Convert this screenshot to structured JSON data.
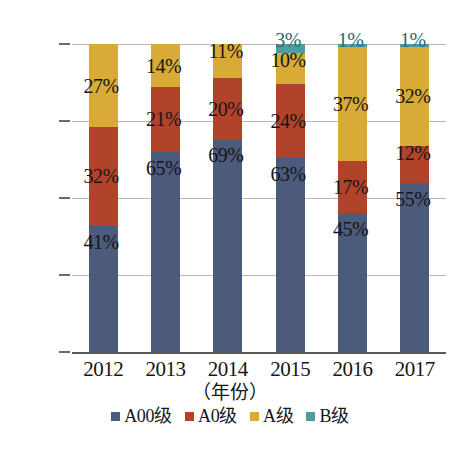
{
  "chart_data": {
    "type": "bar",
    "subtype": "stacked-100-percent",
    "title": "",
    "xlabel": "（年份）",
    "ylabel": "",
    "categories": [
      "2012",
      "2013",
      "2014",
      "2015",
      "2016",
      "2017"
    ],
    "ylim": [
      0,
      100
    ],
    "ytick_labels": [
      "0%",
      "25%",
      "50%",
      "75%",
      "100%"
    ],
    "ytick_values": [
      0,
      25,
      50,
      75,
      100
    ],
    "grid": true,
    "legend_position": "bottom",
    "series": [
      {
        "name": "A00级",
        "color": "#4c5a7c",
        "values": [
          41,
          65,
          69,
          63,
          45,
          55
        ],
        "labels": [
          "41%",
          "65%",
          "69%",
          "63%",
          "45%",
          "55%"
        ]
      },
      {
        "name": "A0级",
        "color": "#b2432b",
        "values": [
          32,
          21,
          20,
          24,
          17,
          12
        ],
        "labels": [
          "32%",
          "21%",
          "20%",
          "24%",
          "17%",
          "12%"
        ]
      },
      {
        "name": "A级",
        "color": "#d7ab35",
        "values": [
          27,
          14,
          11,
          10,
          37,
          32
        ],
        "labels": [
          "27%",
          "14%",
          "11%",
          "10%",
          "37%",
          "32%"
        ]
      },
      {
        "name": "B级",
        "color": "#4e9c9c",
        "values": [
          0,
          0,
          0,
          3,
          1,
          1
        ],
        "labels": [
          "",
          "",
          "",
          "3%",
          "1%",
          "1%"
        ]
      }
    ]
  },
  "axis": {
    "y_ticks": [
      {
        "label": "100%",
        "value": 100
      },
      {
        "label": "75%",
        "value": 75
      },
      {
        "label": "50%",
        "value": 50
      },
      {
        "label": "25%",
        "value": 25
      },
      {
        "label": "0%",
        "value": 0
      }
    ],
    "x_ticks": [
      "2012",
      "2013",
      "2014",
      "2015",
      "2016",
      "2017"
    ],
    "x_title": "（年份）"
  },
  "legend": {
    "items": [
      {
        "label": "A00级",
        "color": "#4c5a7c"
      },
      {
        "label": "A0级",
        "color": "#b2432b"
      },
      {
        "label": "A级",
        "color": "#d7ab35"
      },
      {
        "label": "B级",
        "color": "#4e9c9c"
      }
    ]
  },
  "colors": {
    "a00": "#4c5a7c",
    "a0": "#b2432b",
    "a": "#d7ab35",
    "b": "#4e9c9c",
    "grid": "#b9b9b9",
    "axis": "#5a5a5a",
    "text": "#161616",
    "background": "#ffffff"
  }
}
